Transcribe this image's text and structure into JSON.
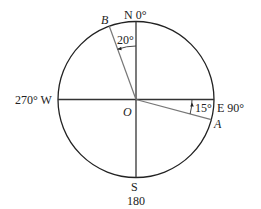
{
  "diagram": {
    "type": "compass-bearing",
    "center": {
      "label": "O"
    },
    "directions": {
      "north": "N 0°",
      "east": "E 90°",
      "south": "S",
      "south_value": "180",
      "west": "270° W"
    },
    "points": [
      {
        "label": "B",
        "angle_label": "20°",
        "bearing_deg": 340
      },
      {
        "label": "A",
        "angle_label": "15°",
        "bearing_deg": 105
      }
    ],
    "colors": {
      "circle": "#222222",
      "axes": "#333333",
      "rays": "#777777",
      "text": "#222222"
    }
  }
}
